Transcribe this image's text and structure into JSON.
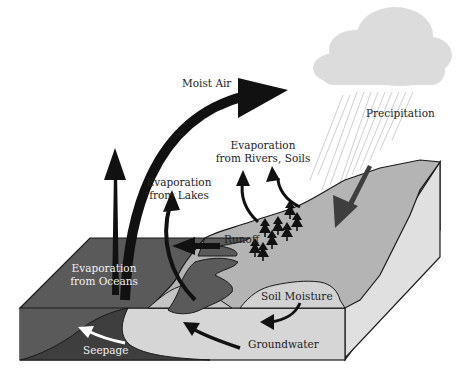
{
  "diagram": {
    "colors": {
      "background": "#ffffff",
      "ocean_top": "#5a5a5a",
      "ocean_side": "#4e4e4e",
      "land_top": "#b4b4b4",
      "land_side_front": "#d6d6d6",
      "land_side_right": "#e2e2e2",
      "soil_moisture": "#d2d2d2",
      "cloud": "#dcdcdc",
      "rain": "#d0d0d0",
      "arrow": "#111111",
      "precip_arrow": "#4a4a4a",
      "seepage_arrow": "#ffffff",
      "outline": "#1a1a1a"
    },
    "labels": {
      "moist_air": "Moist Air",
      "precipitation": "Precipitation",
      "evap_rivers_line1": "Evaporation",
      "evap_rivers_line2": "from Rivers, Soils",
      "evap_lakes_line1": "Evaporation",
      "evap_lakes_line2": "from Lakes",
      "runoff": "Runoff",
      "evap_oceans_line1": "Evaporation",
      "evap_oceans_line2": "from Oceans",
      "soil_moisture": "Soil Moisture",
      "groundwater": "Groundwater",
      "seepage": "Seepage"
    },
    "icons": {
      "cloud": "cloud-icon",
      "trees": "tree-icon",
      "arrows": "arrow-icon"
    },
    "tree_count": 9
  }
}
